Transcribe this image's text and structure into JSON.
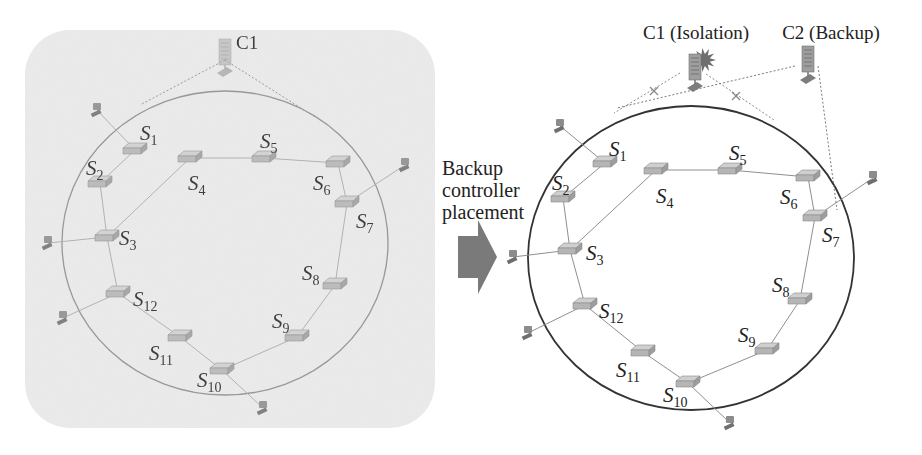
{
  "figure": {
    "transition": {
      "label_lines": [
        "Backup",
        "controller",
        "placement"
      ],
      "arrow_color": "#7a7a7a"
    },
    "colors": {
      "left_panel_bg": "#ebebeb",
      "ring_left": "#8a8a8a",
      "ring_right": "#333333",
      "link": "#9a9a9a",
      "switch": "#b5b5b5",
      "host": "#8c8c8c",
      "isolation_burst": "#6e6e6e",
      "label_text": "#222222"
    },
    "left_panel": {
      "title": "Before",
      "controller": {
        "label": "C1",
        "x": 225,
        "y": 55
      },
      "ring": {
        "cx": 225,
        "cy": 243,
        "rx": 163,
        "ry": 152
      },
      "switches": [
        {
          "id": "S1",
          "base": "S",
          "sub": "1",
          "x": 135,
          "y": 150,
          "lx": 140,
          "ly": 140
        },
        {
          "id": "S2",
          "base": "S",
          "sub": "2",
          "x": 100,
          "y": 183,
          "lx": 86,
          "ly": 175
        },
        {
          "id": "S3",
          "base": "S",
          "sub": "3",
          "x": 107,
          "y": 237,
          "lx": 119,
          "ly": 245
        },
        {
          "id": "S4",
          "base": "S",
          "sub": "4",
          "x": 190,
          "y": 158,
          "lx": 188,
          "ly": 190
        },
        {
          "id": "S5",
          "base": "S",
          "sub": "5",
          "x": 264,
          "y": 158,
          "lx": 260,
          "ly": 148
        },
        {
          "id": "S6",
          "base": "S",
          "sub": "6",
          "x": 338,
          "y": 163,
          "lx": 313,
          "ly": 190
        },
        {
          "id": "S7",
          "base": "S",
          "sub": "7",
          "x": 347,
          "y": 203,
          "lx": 356,
          "ly": 228
        },
        {
          "id": "S8",
          "base": "S",
          "sub": "8",
          "x": 335,
          "y": 285,
          "lx": 302,
          "ly": 280
        },
        {
          "id": "S9",
          "base": "S",
          "sub": "9",
          "x": 297,
          "y": 337,
          "lx": 272,
          "ly": 328
        },
        {
          "id": "S10",
          "base": "S",
          "sub": "10",
          "x": 222,
          "y": 370,
          "lx": 197,
          "ly": 387
        },
        {
          "id": "S11",
          "base": "S",
          "sub": "11",
          "x": 180,
          "y": 337,
          "lx": 149,
          "ly": 360
        },
        {
          "id": "S12",
          "base": "S",
          "sub": "12",
          "x": 118,
          "y": 293,
          "lx": 133,
          "ly": 306
        }
      ],
      "hosts": [
        {
          "x": 97,
          "y": 110,
          "to": "S1"
        },
        {
          "x": 405,
          "y": 165,
          "to": "S7"
        },
        {
          "x": 48,
          "y": 243,
          "to": "S3"
        },
        {
          "x": 63,
          "y": 318,
          "to": "S12"
        },
        {
          "x": 263,
          "y": 408,
          "to": "S10"
        }
      ],
      "controller_links": [
        {
          "to_x": 140,
          "to_y": 105
        },
        {
          "to_x": 315,
          "to_y": 117
        }
      ]
    },
    "right_panel": {
      "title": "After",
      "controllers": [
        {
          "label": "C1 (Isolation)",
          "x": 695,
          "y": 70,
          "status": "isolated",
          "lx": 696,
          "ly": 39
        },
        {
          "label": "C2 (Backup)",
          "x": 808,
          "y": 62,
          "status": "backup",
          "lx": 831,
          "ly": 39
        }
      ],
      "ring": {
        "cx": 691,
        "cy": 258,
        "rx": 163,
        "ry": 152
      },
      "switches": [
        {
          "id": "S1",
          "base": "S",
          "sub": "1",
          "x": 605,
          "y": 163,
          "lx": 609,
          "ly": 156
        },
        {
          "id": "S2",
          "base": "S",
          "sub": "2",
          "x": 563,
          "y": 198,
          "lx": 552,
          "ly": 190
        },
        {
          "id": "S3",
          "base": "S",
          "sub": "3",
          "x": 570,
          "y": 250,
          "lx": 586,
          "ly": 260
        },
        {
          "id": "S4",
          "base": "S",
          "sub": "4",
          "x": 656,
          "y": 170,
          "lx": 656,
          "ly": 203
        },
        {
          "id": "S5",
          "base": "S",
          "sub": "5",
          "x": 730,
          "y": 170,
          "lx": 729,
          "ly": 160
        },
        {
          "id": "S6",
          "base": "S",
          "sub": "6",
          "x": 808,
          "y": 177,
          "lx": 780,
          "ly": 204
        },
        {
          "id": "S7",
          "base": "S",
          "sub": "7",
          "x": 815,
          "y": 217,
          "lx": 822,
          "ly": 242
        },
        {
          "id": "S8",
          "base": "S",
          "sub": "8",
          "x": 800,
          "y": 300,
          "lx": 772,
          "ly": 292
        },
        {
          "id": "S9",
          "base": "S",
          "sub": "9",
          "x": 767,
          "y": 350,
          "lx": 738,
          "ly": 342
        },
        {
          "id": "S10",
          "base": "S",
          "sub": "10",
          "x": 688,
          "y": 383,
          "lx": 663,
          "ly": 402
        },
        {
          "id": "S11",
          "base": "S",
          "sub": "11",
          "x": 643,
          "y": 352,
          "lx": 616,
          "ly": 377
        },
        {
          "id": "S12",
          "base": "S",
          "sub": "12",
          "x": 585,
          "y": 305,
          "lx": 599,
          "ly": 318
        }
      ],
      "hosts": [
        {
          "x": 560,
          "y": 126,
          "to": "S1"
        },
        {
          "x": 873,
          "y": 178,
          "to": "S7"
        },
        {
          "x": 513,
          "y": 257,
          "to": "S3"
        },
        {
          "x": 528,
          "y": 333,
          "to": "S12"
        },
        {
          "x": 730,
          "y": 423,
          "to": "S10"
        }
      ],
      "failed_links": [
        {
          "from_x": 680,
          "from_y": 73,
          "to_x": 614,
          "to_y": 113,
          "x_mark_x": 654,
          "x_mark_y": 91
        },
        {
          "from_x": 706,
          "from_y": 74,
          "to_x": 774,
          "to_y": 120,
          "x_mark_x": 736,
          "x_mark_y": 96
        }
      ],
      "backup_links": [
        {
          "from_x": 795,
          "from_y": 66,
          "to_x": 617,
          "to_y": 108
        },
        {
          "from_x": 818,
          "from_y": 66,
          "to_x": 837,
          "to_y": 210
        }
      ]
    },
    "links": [
      [
        "S1",
        "S2"
      ],
      [
        "S2",
        "S3"
      ],
      [
        "S3",
        "S4"
      ],
      [
        "S4",
        "S5"
      ],
      [
        "S5",
        "S6"
      ],
      [
        "S6",
        "S7"
      ],
      [
        "S7",
        "S8"
      ],
      [
        "S8",
        "S9"
      ],
      [
        "S9",
        "S10"
      ],
      [
        "S10",
        "S11"
      ],
      [
        "S11",
        "S12"
      ],
      [
        "S12",
        "S3"
      ]
    ]
  }
}
